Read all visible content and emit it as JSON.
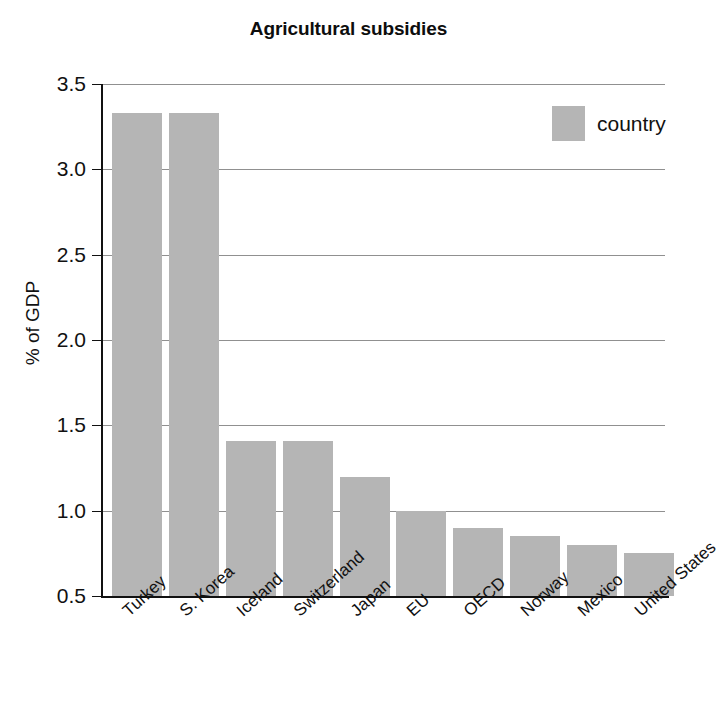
{
  "chart_data": {
    "type": "bar",
    "title": "Agricultural subsidies",
    "xlabel": "",
    "ylabel": "% of GDP",
    "ylim": [
      0.5,
      3.5
    ],
    "ytick_labels": [
      "3.5",
      "3.0",
      "2.5",
      "2.0",
      "1.5",
      "1.0",
      "0.5"
    ],
    "yticks": [
      3.5,
      3.0,
      2.5,
      2.0,
      1.5,
      1.0,
      0.5
    ],
    "grid": true,
    "legend": {
      "position": "top-right",
      "entries": [
        {
          "label": "country",
          "color": "#b5b5b5"
        }
      ]
    },
    "categories": [
      "Turkey",
      "S. Korea",
      "Iceland",
      "Switzerland",
      "Japan",
      "EU",
      "OECD",
      "Norway",
      "Mexico",
      "United States"
    ],
    "values": [
      3.33,
      3.33,
      1.41,
      1.41,
      1.2,
      1.0,
      0.9,
      0.85,
      0.8,
      0.75
    ],
    "series": [
      {
        "name": "country",
        "color": "#b5b5b5",
        "values": [
          3.33,
          3.33,
          1.41,
          1.41,
          1.2,
          1.0,
          0.9,
          0.85,
          0.8,
          0.75
        ]
      }
    ]
  },
  "colors": {
    "bar": "#b5b5b5",
    "axis": "#111111",
    "grid": "#909090",
    "background": "#ffffff",
    "text": "#111111"
  }
}
